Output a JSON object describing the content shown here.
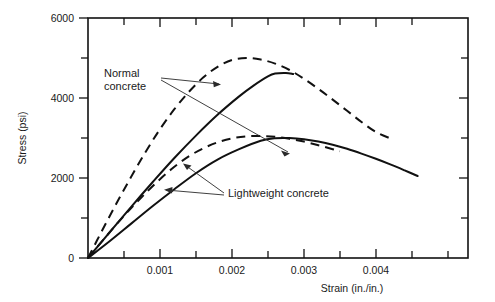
{
  "chart_data": {
    "type": "line",
    "title": "",
    "xlabel": "Strain (in./in.)",
    "ylabel": "Stress (psi)",
    "xlim": [
      0,
      0.00528
    ],
    "ylim": [
      0,
      6000
    ],
    "grid": false,
    "legend_position": "inline-annotations",
    "x_ticks_major": [
      0.001,
      0.002,
      0.003,
      0.004
    ],
    "x_tick_labels": [
      "0.001",
      "0.002",
      "0.003",
      "0.004"
    ],
    "x_ticks_minor": [
      0.0005,
      0.0015,
      0.0025,
      0.0035,
      0.0045,
      0.005
    ],
    "y_ticks_major": [
      0,
      2000,
      4000,
      6000
    ],
    "y_tick_labels": [
      "0",
      "2000",
      "4000",
      "6000"
    ],
    "y_ticks_minor": [
      1000,
      3000,
      5000
    ],
    "annotations": [
      {
        "text": "Normal",
        "x": 0.00048,
        "y": 4700
      },
      {
        "text": "concrete",
        "x": 0.00048,
        "y": 4420
      },
      {
        "text": "Lightweight concrete",
        "x": 0.00163,
        "y": 1900
      }
    ],
    "series": [
      {
        "name": "Normal concrete (dashed)",
        "style": "dashed",
        "peak_strain": 0.0022,
        "peak_stress": 5000,
        "end_strain": 0.0042,
        "end_stress": 3000,
        "points": [
          [
            0.0,
            0
          ],
          [
            0.0002,
            700
          ],
          [
            0.0004,
            1380
          ],
          [
            0.0006,
            2030
          ],
          [
            0.0008,
            2650
          ],
          [
            0.001,
            3220
          ],
          [
            0.0012,
            3720
          ],
          [
            0.0014,
            4150
          ],
          [
            0.0016,
            4510
          ],
          [
            0.0018,
            4780
          ],
          [
            0.002,
            4950
          ],
          [
            0.0022,
            5000
          ],
          [
            0.0024,
            4960
          ],
          [
            0.0026,
            4860
          ],
          [
            0.0028,
            4700
          ],
          [
            0.003,
            4480
          ],
          [
            0.0032,
            4230
          ],
          [
            0.0034,
            3960
          ],
          [
            0.0036,
            3680
          ],
          [
            0.0038,
            3400
          ],
          [
            0.004,
            3150
          ],
          [
            0.0042,
            2990
          ]
        ]
      },
      {
        "name": "Normal concrete (solid)",
        "style": "solid",
        "peak_strain": 0.00255,
        "peak_stress": 4620,
        "end_strain": 0.00285,
        "end_stress": 4550,
        "points": [
          [
            0.0,
            0
          ],
          [
            0.0003,
            640
          ],
          [
            0.0006,
            1280
          ],
          [
            0.0009,
            1900
          ],
          [
            0.0012,
            2500
          ],
          [
            0.0015,
            3060
          ],
          [
            0.0018,
            3580
          ],
          [
            0.0021,
            4040
          ],
          [
            0.0023,
            4310
          ],
          [
            0.0025,
            4540
          ],
          [
            0.0026,
            4610
          ],
          [
            0.00275,
            4625
          ],
          [
            0.00285,
            4600
          ]
        ]
      },
      {
        "name": "Lightweight concrete (dashed)",
        "style": "dashed",
        "peak_strain": 0.0024,
        "peak_stress": 3050,
        "end_strain": 0.0035,
        "end_stress": 2680,
        "points": [
          [
            0.0,
            0
          ],
          [
            0.0002,
            430
          ],
          [
            0.0004,
            850
          ],
          [
            0.0006,
            1250
          ],
          [
            0.0008,
            1620
          ],
          [
            0.001,
            1970
          ],
          [
            0.0012,
            2280
          ],
          [
            0.0014,
            2540
          ],
          [
            0.0016,
            2740
          ],
          [
            0.0018,
            2890
          ],
          [
            0.002,
            2990
          ],
          [
            0.0022,
            3040
          ],
          [
            0.0024,
            3050
          ],
          [
            0.0026,
            3030
          ],
          [
            0.0028,
            2980
          ],
          [
            0.003,
            2910
          ],
          [
            0.0032,
            2820
          ],
          [
            0.0034,
            2720
          ],
          [
            0.0035,
            2670
          ]
        ]
      },
      {
        "name": "Lightweight concrete (solid)",
        "style": "solid",
        "peak_strain": 0.0026,
        "peak_stress": 3000,
        "end_strain": 0.00458,
        "end_stress": 2050,
        "points": [
          [
            0.0,
            0
          ],
          [
            0.0003,
            420
          ],
          [
            0.0006,
            860
          ],
          [
            0.0009,
            1300
          ],
          [
            0.0012,
            1720
          ],
          [
            0.0015,
            2120
          ],
          [
            0.0018,
            2460
          ],
          [
            0.0021,
            2720
          ],
          [
            0.0024,
            2930
          ],
          [
            0.0026,
            2995
          ],
          [
            0.0028,
            3000
          ],
          [
            0.003,
            2970
          ],
          [
            0.0032,
            2910
          ],
          [
            0.0034,
            2830
          ],
          [
            0.0036,
            2730
          ],
          [
            0.0038,
            2610
          ],
          [
            0.004,
            2480
          ],
          [
            0.0042,
            2340
          ],
          [
            0.0044,
            2190
          ],
          [
            0.00458,
            2050
          ]
        ]
      }
    ]
  },
  "figure": {
    "background_color": "#ffffff",
    "line_color": "#111111",
    "text_color": "#1a1a1a"
  }
}
